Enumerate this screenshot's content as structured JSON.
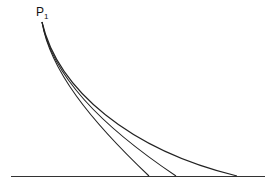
{
  "diagram": {
    "point_label": "P",
    "point_subscript": "1",
    "curves": 3
  }
}
